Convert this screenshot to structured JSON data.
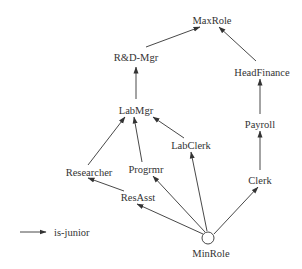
{
  "diagram": {
    "type": "role-hierarchy",
    "nodes": {
      "maxrole": {
        "label": "MaxRole",
        "x": 212,
        "y": 20
      },
      "rdmgr": {
        "label": "R&D-Mgr",
        "x": 136,
        "y": 57
      },
      "headfinance": {
        "label": "HeadFinance",
        "x": 262,
        "y": 72
      },
      "labmgr": {
        "label": "LabMgr",
        "x": 136,
        "y": 110
      },
      "payroll": {
        "label": "Payroll",
        "x": 260,
        "y": 124
      },
      "labclerk": {
        "label": "LabClerk",
        "x": 191,
        "y": 145
      },
      "researcher": {
        "label": "Researcher",
        "x": 89,
        "y": 172
      },
      "progrmr": {
        "label": "Progrmr",
        "x": 146,
        "y": 169
      },
      "clerk": {
        "label": "Clerk",
        "x": 260,
        "y": 180
      },
      "resasst": {
        "label": "ResAsst",
        "x": 138,
        "y": 197
      },
      "minrole": {
        "label": "MinRole",
        "x": 208,
        "y": 238
      }
    },
    "edges": [
      {
        "from": "R&D-Mgr",
        "to": "MaxRole"
      },
      {
        "from": "HeadFinance",
        "to": "MaxRole"
      },
      {
        "from": "LabMgr",
        "to": "R&D-Mgr"
      },
      {
        "from": "Payroll",
        "to": "HeadFinance"
      },
      {
        "from": "Researcher",
        "to": "LabMgr"
      },
      {
        "from": "Progrmr",
        "to": "LabMgr"
      },
      {
        "from": "LabClerk",
        "to": "LabMgr"
      },
      {
        "from": "Clerk",
        "to": "Payroll"
      },
      {
        "from": "ResAsst",
        "to": "Researcher"
      },
      {
        "from": "MinRole",
        "to": "ResAsst"
      },
      {
        "from": "MinRole",
        "to": "Progrmr"
      },
      {
        "from": "MinRole",
        "to": "LabClerk"
      },
      {
        "from": "MinRole",
        "to": "Clerk"
      }
    ],
    "legend": {
      "label": "is-junior",
      "icon": "arrow-right-icon"
    },
    "colors": {
      "line": "#333333",
      "text": "#333333",
      "background": "#ffffff"
    }
  }
}
